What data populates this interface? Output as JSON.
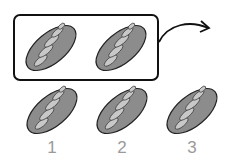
{
  "diagram": {
    "group_box": {
      "label": "group of 2 loaves",
      "count": 2
    },
    "row": {
      "count": 3
    },
    "labels": [
      "1",
      "2",
      "3"
    ],
    "arrow": "curved-arrow-right"
  },
  "colors": {
    "bread_fill": "#8c8c8c",
    "slash_fill": "#c8c8c8",
    "outline": "#222222",
    "label": "#9a9a9a"
  }
}
